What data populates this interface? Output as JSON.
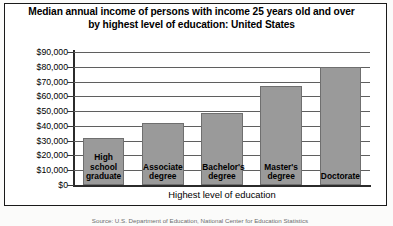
{
  "figure": {
    "title_line1": "Median annual income of persons with income 25 years old and over",
    "title_line2": "by highest level of education: United States",
    "source_note": "Source: U.S. Department of Education, National Center for Education Statistics"
  },
  "chart_data": {
    "type": "bar",
    "title": "Median annual income of persons with income 25 years old and over by highest level of education: United States",
    "categories": [
      "High school graduate",
      "Associate degree",
      "Bachelor's degree",
      "Master's degree",
      "Doctorate"
    ],
    "category_lines": [
      [
        "High",
        "school",
        "graduate"
      ],
      [
        "Associate",
        "degree"
      ],
      [
        "Bachelor's",
        "degree"
      ],
      [
        "Master's",
        "degree"
      ],
      [
        "Doctorate"
      ]
    ],
    "values": [
      32000,
      42000,
      49000,
      67000,
      80000
    ],
    "xlabel": "Highest level of education",
    "ylabel": "",
    "ylim": [
      0,
      90000
    ],
    "ytick_values": [
      0,
      10000,
      20000,
      30000,
      40000,
      50000,
      60000,
      70000,
      80000,
      90000
    ],
    "ytick_labels": [
      "$0",
      "$10,000",
      "$20,000",
      "$30,000",
      "$40,000",
      "$50,000",
      "$60,000",
      "$70,000",
      "$80,000",
      "$90,000"
    ],
    "grid": true,
    "legend": false,
    "bar_color": "#9a9a9a",
    "bar_edge_color": "#6f6f6f"
  }
}
